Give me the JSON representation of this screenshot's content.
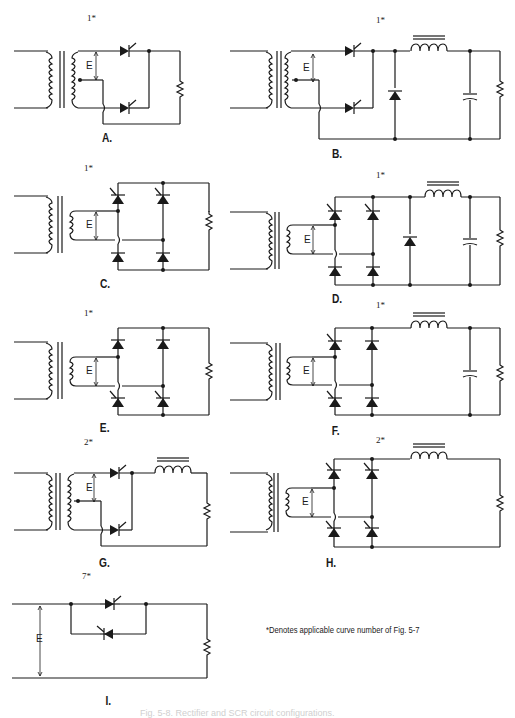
{
  "figure": {
    "panels": [
      {
        "id": "A",
        "label": "A.",
        "curve": "1*"
      },
      {
        "id": "B",
        "label": "B.",
        "curve": "1*"
      },
      {
        "id": "C",
        "label": "C.",
        "curve": "1*"
      },
      {
        "id": "D",
        "label": "D.",
        "curve": "1*"
      },
      {
        "id": "E",
        "label": "E.",
        "curve": "1*"
      },
      {
        "id": "F",
        "label": "F.",
        "curve": "1*"
      },
      {
        "id": "G",
        "label": "G.",
        "curve": "2*"
      },
      {
        "id": "H",
        "label": "H.",
        "curve": "2*"
      },
      {
        "id": "I",
        "label": "I.",
        "curve": "7*"
      }
    ],
    "voltage_label": "E",
    "footnote": "*Denotes applicable curve number of Fig. 5-7",
    "caption": "Fig. 5-8. Rectifier and SCR circuit configurations."
  }
}
